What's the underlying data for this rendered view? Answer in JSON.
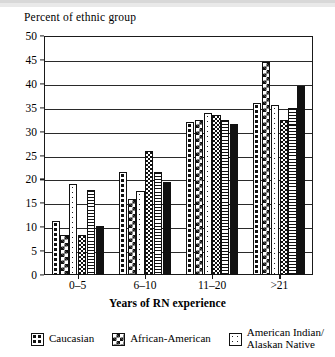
{
  "chart_data": {
    "type": "bar",
    "title": "",
    "ylabel": "Percent of ethnic group",
    "xlabel": "Years of RN experience",
    "categories": [
      "0–5",
      "6–10",
      "11–20",
      ">21"
    ],
    "ylim": [
      0,
      50
    ],
    "yticks": [
      0,
      5,
      10,
      15,
      20,
      25,
      30,
      35,
      40,
      45,
      50
    ],
    "ytick_labels": [
      "0",
      "5",
      "10",
      "15",
      "20",
      "25",
      "30",
      "35",
      "40",
      "45",
      "50"
    ],
    "grid": true,
    "legend_position": "bottom",
    "series": [
      {
        "name": "Caucasian",
        "pattern": "coarse-dots",
        "values": [
          11.3,
          21.5,
          32.0,
          36.0
        ]
      },
      {
        "name": "African-American",
        "pattern": "checkerboard",
        "values": [
          8.3,
          16.0,
          32.5,
          44.5
        ]
      },
      {
        "name": "American Indian/Alaskan Native",
        "pattern": "sparse-dots",
        "values": [
          19.0,
          17.5,
          33.8,
          35.5
        ]
      },
      {
        "name": "Series 4",
        "pattern": "fine-stipple",
        "values": [
          8.3,
          26.0,
          33.5,
          32.5
        ]
      },
      {
        "name": "Series 5",
        "pattern": "horizontal-lines",
        "values": [
          17.7,
          21.5,
          32.5,
          35.0
        ]
      },
      {
        "name": "Series 6",
        "pattern": "solid-black",
        "values": [
          10.3,
          19.5,
          31.5,
          39.5
        ]
      }
    ]
  },
  "legend": {
    "items": [
      {
        "label": "Caucasian",
        "swatch": "coarse-dots-swatch"
      },
      {
        "label": "African-American",
        "swatch": "checkerboard-swatch"
      },
      {
        "label": "American Indian/\nAlaskan Native",
        "swatch": "sparse-dots-swatch"
      }
    ]
  },
  "colors": {
    "ink": "#111111",
    "paper": "#ffffff",
    "grid": "#2a2a2a"
  }
}
